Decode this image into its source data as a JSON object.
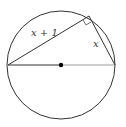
{
  "diagram": {
    "labels": {
      "hypotenuse_leg": "x + 1",
      "short_leg": "x"
    },
    "colors": {
      "stroke": "#333333",
      "diameter_right": "#9a9a9a",
      "center_dot": "#000000"
    }
  }
}
